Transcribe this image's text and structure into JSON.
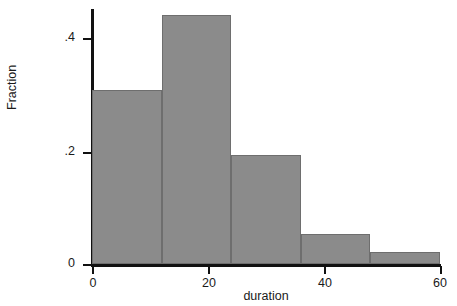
{
  "chart_data": {
    "type": "bar",
    "title": "",
    "subtitle": "",
    "xlabel": "duration",
    "ylabel": "Fraction",
    "xlim": [
      0,
      60
    ],
    "ylim": [
      0,
      0.47
    ],
    "grid": false,
    "legend": null,
    "bin_width": 12,
    "bin_edges": [
      0,
      12,
      24,
      36,
      48,
      60
    ],
    "categories": [
      "0-12",
      "12-24",
      "24-36",
      "36-48",
      "48-60"
    ],
    "values": [
      0.31,
      0.445,
      0.195,
      0.053,
      0.022
    ],
    "x_ticks": [
      0,
      20,
      40,
      60
    ],
    "x_ticklabels": [
      "0",
      "20",
      "40",
      "60"
    ],
    "y_ticks": [
      0,
      0.2,
      0.4
    ],
    "y_ticklabels": [
      "0",
      ".2",
      ".4"
    ],
    "bar_color": "#8b8b8b",
    "bar_edge_color": "#6e6e6e",
    "axis_color": "#111111",
    "background_color": "#ffffff"
  }
}
